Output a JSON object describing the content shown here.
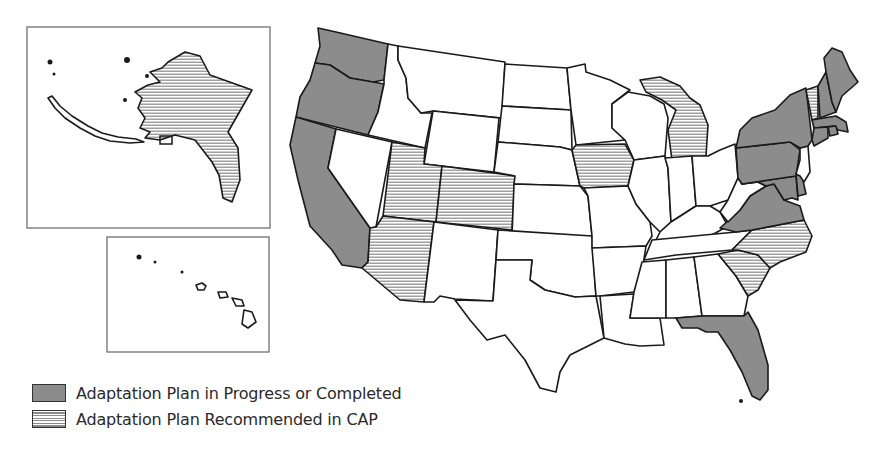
{
  "map_title": "U.S. State Climate Adaptation Plan Status",
  "colors": {
    "progress": "#8c8c8c",
    "recommended_stripe": "#8a8a8a",
    "none": "#ffffff",
    "border": "#1a1a1a"
  },
  "legend": {
    "items": [
      {
        "key": "progress",
        "label": "Adaptation Plan in Progress or Completed"
      },
      {
        "key": "recommended",
        "label": "Adaptation Plan Recommended in CAP"
      }
    ]
  },
  "insets": {
    "alaska": {
      "label": "Alaska",
      "status": "recommended"
    },
    "hawaii": {
      "label": "Hawaii",
      "status": "none"
    }
  },
  "states": {
    "WA": "progress",
    "OR": "progress",
    "CA": "progress",
    "ID": "none",
    "NV": "none",
    "MT": "none",
    "WY": "none",
    "UT": "recommended",
    "CO": "recommended",
    "AZ": "recommended",
    "NM": "none",
    "ND": "none",
    "SD": "none",
    "NE": "none",
    "KS": "none",
    "OK": "none",
    "TX": "none",
    "MN": "none",
    "IA": "recommended",
    "MO": "none",
    "AR": "none",
    "LA": "none",
    "WI": "none",
    "IL": "none",
    "MI": "recommended",
    "IN": "none",
    "OH": "none",
    "KY": "none",
    "TN": "none",
    "MS": "none",
    "AL": "none",
    "GA": "none",
    "FL": "progress",
    "SC": "recommended",
    "NC": "recommended",
    "VA": "progress",
    "WV": "none",
    "MD": "progress",
    "DE": "progress",
    "PA": "progress",
    "NJ": "none",
    "NY": "progress",
    "CT": "progress",
    "RI": "progress",
    "MA": "progress",
    "VT": "recommended",
    "NH": "progress",
    "ME": "progress"
  }
}
